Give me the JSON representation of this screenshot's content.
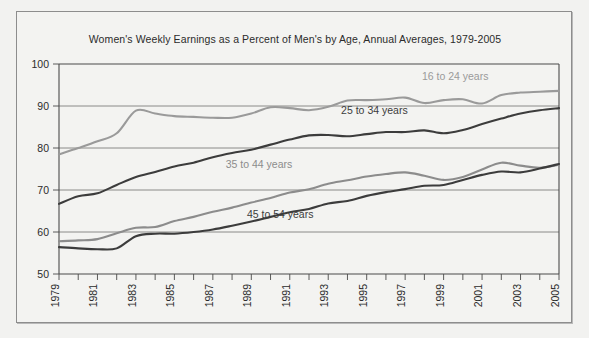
{
  "chart_data": {
    "type": "line",
    "title": "Women's Weekly Earnings as a Percent of Men's by Age, Annual Averages, 1979-2005",
    "xlabel": "",
    "ylabel": "",
    "ylim": [
      50,
      100
    ],
    "yticks": [
      50,
      60,
      70,
      80,
      90,
      100
    ],
    "ytick_labels": [
      "50",
      "60",
      "70",
      "80",
      "90",
      "100"
    ],
    "xlim": [
      1979,
      2005
    ],
    "x": [
      1979,
      1980,
      1981,
      1982,
      1983,
      1984,
      1985,
      1986,
      1987,
      1988,
      1989,
      1990,
      1991,
      1992,
      1993,
      1994,
      1995,
      1996,
      1997,
      1998,
      1999,
      2000,
      2001,
      2002,
      2003,
      2004,
      2005
    ],
    "xtick_labels": [
      "1979",
      "1981",
      "1983",
      "1985",
      "1987",
      "1989",
      "1991",
      "1993",
      "1995",
      "1997",
      "1999",
      "2001",
      "2003",
      "2005"
    ],
    "xtick_values": [
      1979,
      1981,
      1983,
      1985,
      1987,
      1989,
      1991,
      1993,
      1995,
      1997,
      1999,
      2001,
      2003,
      2005
    ],
    "grid": "horizontal",
    "legend_position": "inline-labels",
    "series": [
      {
        "name": "16 to 24 years",
        "color": "#9a9a9a",
        "label_x": 1999.6,
        "label_y": 96.2,
        "values": [
          78.5,
          80.0,
          81.6,
          83.5,
          88.9,
          88.2,
          87.6,
          87.4,
          87.2,
          87.2,
          88.2,
          89.7,
          89.5,
          89.0,
          89.8,
          91.3,
          91.4,
          91.6,
          92.0,
          90.7,
          91.4,
          91.6,
          90.6,
          92.6,
          93.2,
          93.4,
          93.6
        ]
      },
      {
        "name": "25 to 34 years",
        "color": "#3c3c3c",
        "label_x": 1995.4,
        "label_y": 88.0,
        "values": [
          66.7,
          68.5,
          69.2,
          71.2,
          73.1,
          74.3,
          75.6,
          76.5,
          77.8,
          78.8,
          79.6,
          80.8,
          82.0,
          83.0,
          83.1,
          82.8,
          83.3,
          83.8,
          83.8,
          84.2,
          83.5,
          84.3,
          85.7,
          87.0,
          88.2,
          89.0,
          89.5
        ]
      },
      {
        "name": "35 to 44 years",
        "color": "#8c8c8c",
        "label_x": 1989.4,
        "label_y": 75.2,
        "values": [
          57.8,
          58.0,
          58.3,
          59.7,
          61.0,
          61.2,
          62.6,
          63.6,
          64.8,
          65.8,
          67.0,
          68.1,
          69.4,
          70.2,
          71.5,
          72.3,
          73.2,
          73.8,
          74.2,
          73.4,
          72.4,
          73.1,
          74.9,
          76.5,
          75.8,
          75.3,
          76.0
        ]
      },
      {
        "name": "45 to 54 years",
        "color": "#3c3c3c",
        "label_x": 1990.5,
        "label_y": 63.3,
        "values": [
          56.4,
          56.1,
          55.9,
          56.1,
          59.0,
          59.6,
          59.6,
          60.0,
          60.6,
          61.5,
          62.5,
          63.6,
          64.7,
          65.5,
          66.8,
          67.4,
          68.6,
          69.5,
          70.2,
          71.0,
          71.2,
          72.4,
          73.6,
          74.4,
          74.2,
          75.1,
          76.2
        ]
      }
    ]
  },
  "colors": {
    "background": "#f2f2f0",
    "frame_border": "#8d8d8d",
    "axis": "#4a4a4a",
    "grid": "#6e6e6e",
    "text": "#2b2b2b"
  }
}
